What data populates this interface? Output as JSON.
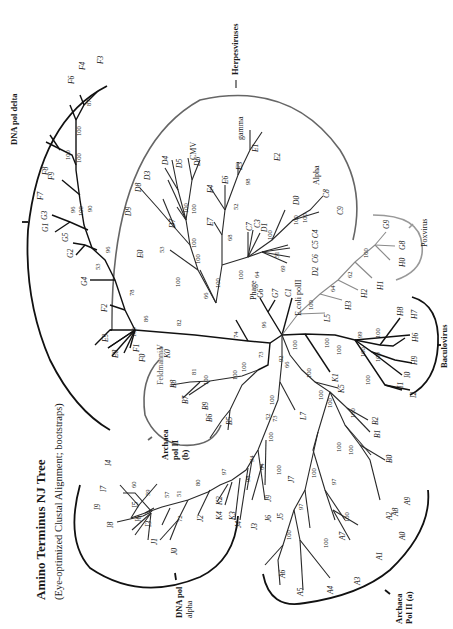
{
  "figure": {
    "title": "Amino Terminus NJ Tree",
    "subtitle": "(Eye-optimized Clustal Alignment; bootstraps)",
    "orientation": "rotated 90° counter-clockwise"
  },
  "groups": {
    "dna_pol_delta": "DNA pol delta",
    "herpesviruses": "Herpesviruses",
    "herpes_gamma": "gamma",
    "herpes_alpha": "Alpha",
    "herpes_cmv": "CMV",
    "poxvirus": "Poxvirus",
    "baculovirus": "Baculovirus",
    "archaea_pol2a_1": "Archaea",
    "archaea_pol2a_2": "Pol II (a)",
    "archaea_pol2b_1": "Archaea",
    "archaea_pol2b_2": "pol II",
    "archaea_pol2b_3": "(b)",
    "dna_pol_alpha_1": "DNA pol",
    "dna_pol_alpha_2": "alpha",
    "phage": "Phage",
    "ecoli": "E.coli polII",
    "feldmannia": "Feldmannia",
    "v": "V"
  },
  "leaves": {
    "F3": "F3",
    "F4": "F4",
    "F6": "F6",
    "F7": "F7",
    "F8": "F8",
    "F9": "F9",
    "G1": "G1",
    "G3": "G3",
    "G5": "G5",
    "G2": "G2",
    "G4": "G4",
    "F2": "F2",
    "E9": "E9",
    "E8": "E8",
    "F1": "F1",
    "F0": "F0",
    "K0": "K0",
    "D9": "D9",
    "D8": "D8",
    "D3": "D3",
    "D4": "D4",
    "D5": "D5",
    "D6": "D6",
    "D7": "D7",
    "E0": "E0",
    "E4": "E4",
    "E6": "E6",
    "E3": "E3",
    "E1": "E1",
    "E2": "E2",
    "E7": "E7",
    "C7": "C7",
    "C3": "C3",
    "D1": "D1",
    "D0": "D0",
    "C8": "C8",
    "C9": "C9",
    "C5C4": "C5 C4",
    "C6": "C6",
    "D2": "D2",
    "G6": "G6",
    "G7": "G7",
    "C1": "C1",
    "G9": "G9",
    "G8": "G8",
    "H0": "H0",
    "H1": "H1",
    "H2": "H2",
    "H3": "H3",
    "L5": "L5",
    "H8": "H8",
    "H7": "H7",
    "H6": "H6",
    "H9": "H9",
    "I0": "I0",
    "I1": "I1",
    "I2": "I2",
    "K1": "K1",
    "B8": "B8",
    "B7": "B7",
    "B9": "B9",
    "B6": "B6",
    "B5": "B5",
    "K5": "K5",
    "B2": "B2",
    "B1": "B1",
    "B0": "B0",
    "A9": "A9",
    "A8": "A8",
    "A2": "A2",
    "A0": "A0",
    "A1": "A1",
    "A7": "A7",
    "A3": "A3",
    "A4": "A4",
    "A5": "A5",
    "A6": "A6",
    "L7": "L7",
    "I4": "I4",
    "I7": "I7",
    "I9": "I9",
    "I8": "I8",
    "I5": "I5",
    "I6": "I6",
    "I3": "I3",
    "J1": "J1",
    "J0": "J0",
    "J2": "J2",
    "K2": "K2",
    "K4": "K4",
    "K3": "K3",
    "J4": "J4",
    "J3": "J3",
    "J9": "J9",
    "J6": "J6",
    "J5": "J5",
    "J7": "J7"
  },
  "bootstraps": {
    "delta": [
      "87",
      "100",
      "100",
      "100",
      "100",
      "90",
      "96",
      "53",
      "96",
      "78",
      "86",
      "100",
      "82"
    ],
    "herpes": [
      "100",
      "100",
      "100",
      "100",
      "53",
      "100",
      "66",
      "68",
      "52",
      "98",
      "100",
      "100",
      "100",
      "51",
      "64",
      "69",
      "100",
      "100",
      "74"
    ],
    "pox": [
      "96",
      "100",
      "64",
      "62",
      "100"
    ],
    "bacu": [
      "100",
      "100",
      "100",
      "99",
      "100",
      "100",
      "100",
      "100"
    ],
    "arch_b": [
      "100",
      "81",
      "100",
      "100",
      "73"
    ],
    "arch_a": [
      "92",
      "66",
      "100",
      "100",
      "100",
      "100",
      "100",
      "100",
      "97",
      "100",
      "100",
      "97",
      "100",
      "100"
    ],
    "alpha": [
      "73",
      "100",
      "52",
      "94",
      "64",
      "100",
      "98",
      "97",
      "80",
      "51",
      "57",
      "59",
      "60",
      "72",
      "100"
    ]
  }
}
